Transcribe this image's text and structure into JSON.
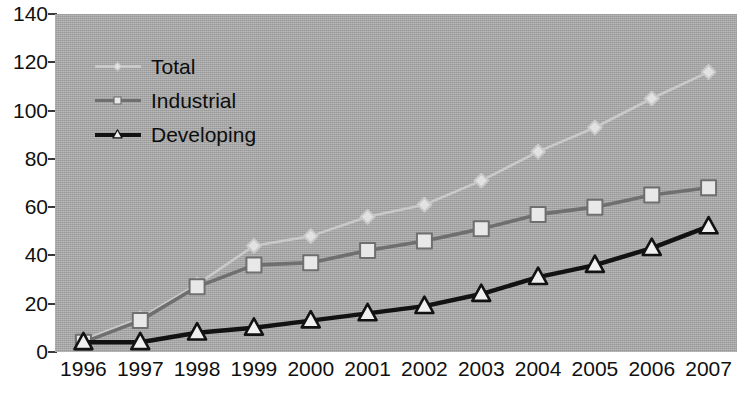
{
  "chart_data": {
    "type": "line",
    "title": "",
    "xlabel": "",
    "ylabel": "",
    "categories": [
      "1996",
      "1997",
      "1998",
      "1999",
      "2000",
      "2001",
      "2002",
      "2003",
      "2004",
      "2005",
      "2006",
      "2007"
    ],
    "x": [
      1996,
      1997,
      1998,
      1999,
      2000,
      2001,
      2002,
      2003,
      2004,
      2005,
      2006,
      2007
    ],
    "ylim": [
      0,
      140
    ],
    "yticks": [
      "0",
      "20",
      "40",
      "60",
      "80",
      "100",
      "120",
      "140"
    ],
    "ytick_values": [
      0,
      20,
      40,
      60,
      80,
      100,
      120,
      140
    ],
    "grid": false,
    "legend_position": "top-left",
    "plot_background": "#a9a9a9",
    "series": [
      {
        "name": "Total",
        "color": "#c9c9c9",
        "marker": "diamond",
        "marker_fill": "#e2e2e2",
        "values": [
          5,
          14,
          28,
          44,
          48,
          56,
          61,
          71,
          83,
          93,
          105,
          116
        ]
      },
      {
        "name": "Industrial",
        "color": "#6f6f6f",
        "marker": "square",
        "marker_fill": "#e8e8e8",
        "values": [
          4,
          13,
          27,
          36,
          37,
          42,
          46,
          51,
          57,
          60,
          65,
          68
        ]
      },
      {
        "name": "Developing",
        "color": "#121212",
        "marker": "triangle",
        "marker_fill": "#f0f0f0",
        "values": [
          4,
          4,
          8,
          10,
          13,
          16,
          19,
          24,
          31,
          36,
          43,
          52
        ]
      }
    ]
  }
}
